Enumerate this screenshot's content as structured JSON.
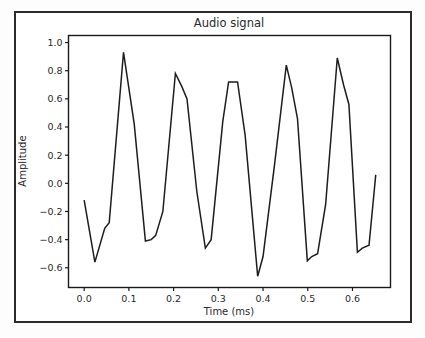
{
  "figure": {
    "title": "Audio signal",
    "background_color": "#ffffff",
    "border_color": "#2b2b2b",
    "line_color": "#1d1d1d"
  },
  "chart_data": {
    "type": "line",
    "title": "Audio signal",
    "xlabel": "Time (ms)",
    "ylabel": "Amplitude",
    "xlim": [
      -0.035,
      0.685
    ],
    "ylim": [
      -0.74,
      1.05
    ],
    "grid": false,
    "legend": null,
    "xticks": [
      0.0,
      0.1,
      0.2,
      0.3,
      0.4,
      0.5,
      0.6
    ],
    "xticklabels": [
      "0.0",
      "0.1",
      "0.2",
      "0.3",
      "0.4",
      "0.5",
      "0.6"
    ],
    "yticks": [
      -0.6,
      -0.4,
      -0.2,
      0.0,
      0.2,
      0.4,
      0.6,
      0.8,
      1.0
    ],
    "yticklabels": [
      "-0.6",
      "-0.4",
      "-0.2",
      "0.0",
      "0.2",
      "0.4",
      "0.6",
      "0.8",
      "1.0"
    ],
    "series": [
      {
        "name": "audio-waveform",
        "color": "#1d1d1d",
        "x": [
          0.0,
          0.024,
          0.046,
          0.056,
          0.088,
          0.112,
          0.137,
          0.15,
          0.16,
          0.176,
          0.204,
          0.218,
          0.23,
          0.252,
          0.271,
          0.284,
          0.31,
          0.323,
          0.343,
          0.36,
          0.388,
          0.4,
          0.426,
          0.452,
          0.464,
          0.477,
          0.499,
          0.509,
          0.522,
          0.54,
          0.566,
          0.58,
          0.592,
          0.611,
          0.622,
          0.637,
          0.652
        ],
        "y": [
          -0.12,
          -0.56,
          -0.32,
          -0.28,
          0.93,
          0.42,
          -0.41,
          -0.4,
          -0.37,
          -0.2,
          0.78,
          0.69,
          0.6,
          -0.06,
          -0.46,
          -0.4,
          0.44,
          0.72,
          0.72,
          0.34,
          -0.66,
          -0.52,
          0.14,
          0.84,
          0.68,
          0.46,
          -0.55,
          -0.52,
          -0.5,
          -0.15,
          0.89,
          0.7,
          0.56,
          -0.49,
          -0.46,
          -0.44,
          0.06
        ]
      }
    ]
  }
}
